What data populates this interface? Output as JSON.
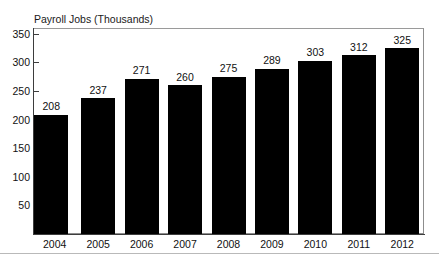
{
  "chart_data": {
    "type": "bar",
    "title_note": "headline cropped at top edge of image",
    "ylabel": "Payroll Jobs (Thousands)",
    "xlabel": "",
    "categories": [
      "2004",
      "2005",
      "2006",
      "2007",
      "2008",
      "2009",
      "2010",
      "2011",
      "2012"
    ],
    "values": [
      208,
      237,
      271,
      260,
      275,
      289,
      303,
      312,
      325
    ],
    "data_labels": [
      "208",
      "237",
      "271",
      "260",
      "275",
      "289",
      "303",
      "312",
      "325"
    ],
    "ylim": [
      0,
      360
    ],
    "ytick_values": [
      50,
      100,
      150,
      200,
      250,
      300,
      350
    ],
    "ytick_labels": [
      "50",
      "100",
      "150",
      "200",
      "250",
      "300",
      "350"
    ],
    "grid": false,
    "legend": null,
    "bar_color": "#000000",
    "axis_color": "#3d3d3d",
    "frame_color": "#8d8d8d",
    "background": "#ffffff"
  }
}
